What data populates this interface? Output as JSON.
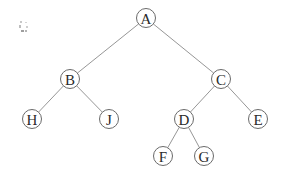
{
  "diagram": {
    "type": "binary-tree",
    "node_radius": 9.5,
    "nodes": [
      {
        "id": "A",
        "label": "A",
        "x": 146,
        "y": 18
      },
      {
        "id": "B",
        "label": "B",
        "x": 70,
        "y": 79
      },
      {
        "id": "C",
        "label": "C",
        "x": 221,
        "y": 79
      },
      {
        "id": "H",
        "label": "H",
        "x": 32,
        "y": 119
      },
      {
        "id": "J",
        "label": "J",
        "x": 109,
        "y": 119
      },
      {
        "id": "D",
        "label": "D",
        "x": 184,
        "y": 119
      },
      {
        "id": "E",
        "label": "E",
        "x": 258,
        "y": 119
      },
      {
        "id": "F",
        "label": "F",
        "x": 163,
        "y": 156
      },
      {
        "id": "G",
        "label": "G",
        "x": 204,
        "y": 156
      }
    ],
    "edges": [
      {
        "from": "A",
        "to": "B"
      },
      {
        "from": "A",
        "to": "C"
      },
      {
        "from": "B",
        "to": "H"
      },
      {
        "from": "B",
        "to": "J"
      },
      {
        "from": "C",
        "to": "D"
      },
      {
        "from": "C",
        "to": "E"
      },
      {
        "from": "D",
        "to": "F"
      },
      {
        "from": "D",
        "to": "G"
      }
    ],
    "colors": {
      "edge": "#8a8a8a",
      "node_stroke": "#6a6a6a",
      "label": "#2a2a2a",
      "background": "#ffffff"
    }
  }
}
